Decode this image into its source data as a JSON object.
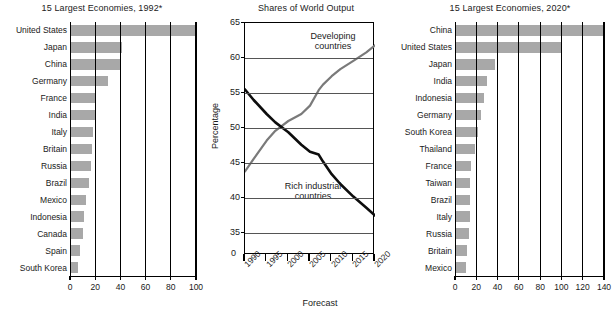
{
  "figure": {
    "panels": [
      "economies-1992",
      "shares-of-world-output",
      "economies-2020"
    ]
  },
  "chart_data": [
    {
      "id": "economies-1992",
      "type": "bar",
      "orientation": "horizontal",
      "title": "15 Largest Economies, 1992*",
      "xlabel": "",
      "ylabel": "",
      "xlim": [
        0,
        100
      ],
      "xticks": [
        0,
        20,
        40,
        60,
        80,
        100
      ],
      "xtick_labels": [
        "0",
        "20",
        "40",
        "60",
        "80",
        "100"
      ],
      "grid": "vertical",
      "legend": "none",
      "bar_color": "#a8a8a8",
      "categories": [
        "United States",
        "Japan",
        "China",
        "Germany",
        "France",
        "India",
        "Italy",
        "Britain",
        "Russia",
        "Brazil",
        "Mexico",
        "Indonesia",
        "Canada",
        "Spain",
        "South Korea"
      ],
      "values": [
        100,
        41,
        40,
        30,
        21,
        20,
        18,
        17.5,
        17,
        15,
        13,
        11,
        10,
        8,
        6.5
      ]
    },
    {
      "id": "shares-of-world-output",
      "type": "line",
      "title": "Shares of World Output",
      "xlabel": "Forecast",
      "ylabel": "Percentage",
      "ylim": [
        35,
        65
      ],
      "yticks": [
        35,
        40,
        45,
        50,
        55,
        60,
        65
      ],
      "ytick_labels": [
        "35",
        "40",
        "45",
        "50",
        "55",
        "60",
        "65"
      ],
      "y_axis_break_label": "0",
      "xlim": [
        1990,
        2020
      ],
      "xticks": [
        1990,
        1995,
        2000,
        2005,
        2010,
        2015,
        2020
      ],
      "xtick_labels": [
        "1990",
        "1995",
        "2000",
        "2005",
        "2010",
        "2015",
        "2020"
      ],
      "grid": "horizontal",
      "legend": "inline-annotations",
      "x": [
        1990,
        1992,
        1995,
        1997,
        2000,
        2003,
        2005,
        2007,
        2008,
        2010,
        2012,
        2015,
        2018,
        2020
      ],
      "series": [
        {
          "name": "Developing countries",
          "color": "#7a7a7a",
          "annotation": "Developing countries",
          "values": [
            43.8,
            45.6,
            48.2,
            49.6,
            51.0,
            52.0,
            53.2,
            55.4,
            56.2,
            57.4,
            58.4,
            59.6,
            60.8,
            61.8
          ]
        },
        {
          "name": "Rich industrial countries",
          "color": "#0d0d0d",
          "annotation": "Rich industrial countries",
          "values": [
            55.5,
            54.0,
            52.0,
            50.8,
            49.4,
            47.6,
            46.6,
            46.2,
            45.2,
            43.4,
            42.0,
            40.2,
            38.6,
            37.5
          ]
        }
      ]
    },
    {
      "id": "economies-2020",
      "type": "bar",
      "orientation": "horizontal",
      "title": "15 Largest Economies, 2020*",
      "xlabel": "",
      "ylabel": "",
      "xlim": [
        0,
        140
      ],
      "xticks": [
        0,
        20,
        40,
        60,
        80,
        100,
        120,
        140
      ],
      "xtick_labels": [
        "0",
        "20",
        "40",
        "60",
        "80",
        "100",
        "120",
        "140"
      ],
      "grid": "vertical",
      "legend": "none",
      "bar_color": "#a8a8a8",
      "categories": [
        "China",
        "United States",
        "Japan",
        "India",
        "Indonesia",
        "Germany",
        "South Korea",
        "Thailand",
        "France",
        "Taiwan",
        "Brazil",
        "Italy",
        "Russia",
        "Britain",
        "Mexico"
      ],
      "values": [
        140,
        100,
        38,
        30,
        27,
        24,
        22,
        19,
        15,
        14,
        14.5,
        14,
        13.5,
        11,
        10
      ]
    }
  ]
}
